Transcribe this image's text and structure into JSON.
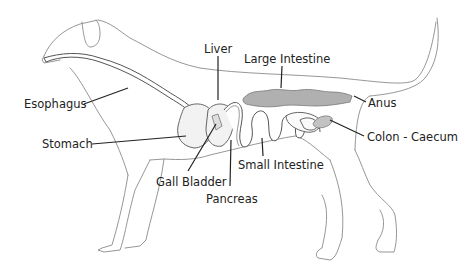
{
  "diagram": {
    "labels": {
      "liver": "Liver",
      "large_intestine": "Large Intestine",
      "esophagus": "Esophagus",
      "anus": "Anus",
      "stomach": "Stomach",
      "colon_caecum": "Colon - Caecum",
      "small_intestine": "Small Intestine",
      "gall_bladder": "Gall Bladder",
      "pancreas": "Pancreas"
    },
    "colors": {
      "outline": "#8a8a8a",
      "large_intestine_fill": "#b0b0b0",
      "organ_fill": "#f2f2f2",
      "label_text": "#222222",
      "background": "#ffffff"
    }
  }
}
